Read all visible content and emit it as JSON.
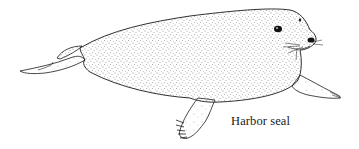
{
  "illustration": {
    "subject": "harbor seal",
    "style": "stippled pen-and-ink drawing",
    "caption": "Harbor seal",
    "colors": {
      "background": "#ffffff",
      "ink": "#1a1a1a"
    }
  }
}
